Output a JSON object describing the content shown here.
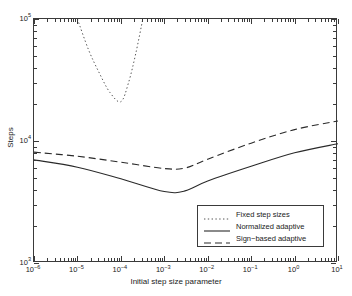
{
  "chart_data": {
    "type": "line",
    "title": "",
    "xlabel": "Initial step size parameter",
    "ylabel": "Steps",
    "xscale": "log",
    "yscale": "log",
    "xlim": [
      1e-06,
      10
    ],
    "ylim": [
      1000,
      100000
    ],
    "grid": false,
    "legend_position": "lower right",
    "xticklabels": [
      "10-6",
      "10-5",
      "10-4",
      "10-3",
      "10-2",
      "10-1",
      "10 0",
      "10 1"
    ],
    "xtick_values": [
      1e-06,
      1e-05,
      0.0001,
      0.001,
      0.01,
      0.1,
      1,
      10
    ],
    "ytick_values": [
      1000,
      10000,
      100000
    ],
    "yticklabels": [
      "10 3",
      "10 4",
      "10 5"
    ],
    "series": [
      {
        "name": "Fixed step sizes",
        "style": "dotted",
        "color": "#555555",
        "x": [
          1e-05,
          1.8e-05,
          3.2e-05,
          5.6e-05,
          0.0001,
          0.00015,
          0.00022,
          0.00032
        ],
        "y": [
          100000,
          56000,
          36000,
          25000,
          21000,
          30000,
          52000,
          100000
        ]
      },
      {
        "name": "Normalized adaptive",
        "style": "solid",
        "color": "#2a2a2a",
        "x": [
          1e-06,
          1e-05,
          0.0001,
          0.001,
          0.003,
          0.01,
          0.1,
          1,
          10
        ],
        "y": [
          7000,
          6100,
          4900,
          3850,
          3900,
          4700,
          6200,
          8000,
          9500
        ]
      },
      {
        "name": "Sign-based adaptive",
        "style": "dashed",
        "color": "#2a2a2a",
        "x": [
          1e-06,
          1e-05,
          0.0001,
          0.001,
          0.003,
          0.01,
          0.1,
          1,
          10
        ],
        "y": [
          8100,
          7500,
          6700,
          5950,
          6000,
          7100,
          9600,
          12400,
          14600
        ]
      }
    ]
  },
  "axes": {
    "x_title": "Initial step size parameter",
    "y_title": "Steps",
    "x_ticks": [
      {
        "exp": "−6",
        "mantissa": "10"
      },
      {
        "exp": "−5",
        "mantissa": "10"
      },
      {
        "exp": "−4",
        "mantissa": "10"
      },
      {
        "exp": "−3",
        "mantissa": "10"
      },
      {
        "exp": "−2",
        "mantissa": "10"
      },
      {
        "exp": "−1",
        "mantissa": "10"
      },
      {
        "exp": "0",
        "mantissa": "10"
      },
      {
        "exp": "1",
        "mantissa": "10"
      }
    ],
    "y_ticks": [
      {
        "exp": "5",
        "mantissa": "10"
      },
      {
        "exp": "4",
        "mantissa": "10"
      },
      {
        "exp": "3",
        "mantissa": "10"
      }
    ]
  },
  "legend": {
    "entries": [
      {
        "label": "Fixed step sizes",
        "style": "dotted"
      },
      {
        "label": "Normalized adaptive",
        "style": "solid"
      },
      {
        "label": "Sign−based adaptive",
        "style": "dashed"
      }
    ]
  },
  "colors": {
    "axis": "#3a3a3a",
    "solid_curve": "#2a2a2a",
    "dashed_curve": "#2a2a2a",
    "dotted_curve": "#555555",
    "background": "#ffffff"
  }
}
